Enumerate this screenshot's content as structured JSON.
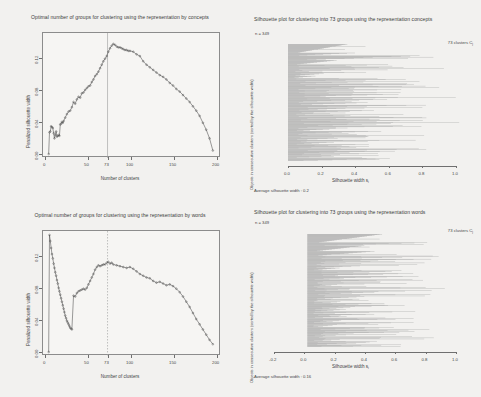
{
  "figure": {
    "background_color": "#f2f1ef",
    "line_color": "#4a4a4a",
    "bar_color": "#a9a9a9",
    "axis_color": "#6f6f6f"
  },
  "panels": {
    "top_left": {
      "title": "Optimal number of groups for clustering using the representation by concepts",
      "xlabel": "Number of clusters",
      "ylabel": "Penalized silhouette width",
      "xticks": [
        "0",
        "50",
        "73",
        "100",
        "150",
        "200"
      ],
      "yticks": [
        "0.00",
        "0.04",
        "0.08",
        "0.12"
      ],
      "marker_label": "73"
    },
    "top_right": {
      "title": "Silhouette plot for clustering into 73 groups using the representation concepts",
      "n_label": "n = 349",
      "clusters_label": "73 clusters",
      "clusters_symbol": "C",
      "clusters_subscript": "j",
      "ylabel": "Objects in consecutive clusters (sorted by the silhouette width)",
      "xlabel": "Silhouette width s",
      "xlabel_subscript": "i",
      "xticks": [
        "0.0",
        "0.2",
        "0.4",
        "0.6",
        "0.8",
        "1.0"
      ],
      "footer": "Average silhouette width :  0.2"
    },
    "bottom_left": {
      "title": "Optimal number of groups for clustering using the representation by words",
      "xlabel": "Number of clusters",
      "ylabel": "Penalized silhouette width",
      "xticks": [
        "0",
        "50",
        "73",
        "100",
        "150",
        "200"
      ],
      "yticks": [
        "0.00",
        "0.04",
        "0.08",
        "0.12"
      ],
      "marker_label": "73"
    },
    "bottom_right": {
      "title": "Silhouette plot for clustering into 73 groups using the representation words",
      "n_label": "n = 349",
      "clusters_label": "73 clusters",
      "clusters_symbol": "C",
      "clusters_subscript": "j",
      "ylabel": "Objects in consecutive clusters (sorted by the silhouette width)",
      "xlabel": "Silhouette width s",
      "xlabel_subscript": "i",
      "xticks": [
        "-0.2",
        "0.0",
        "0.2",
        "0.4",
        "0.6",
        "0.8",
        "1.0"
      ],
      "footer": "Average silhouette width :  0.16"
    }
  },
  "chart_data": [
    {
      "id": "top_left",
      "type": "line",
      "title": "Optimal number of groups for clustering using the representation by concepts",
      "xlabel": "Number of clusters",
      "ylabel": "Penalized silhouette width",
      "xlim": [
        0,
        205
      ],
      "ylim": [
        0.0,
        0.135
      ],
      "grid": false,
      "vline": 73,
      "marker": "circle-open",
      "x": [
        2,
        3,
        4,
        5,
        6,
        7,
        8,
        9,
        10,
        11,
        12,
        13,
        14,
        15,
        16,
        17,
        18,
        19,
        20,
        22,
        24,
        26,
        28,
        30,
        32,
        34,
        36,
        38,
        40,
        42,
        44,
        46,
        48,
        50,
        52,
        54,
        56,
        58,
        60,
        62,
        64,
        66,
        68,
        70,
        72,
        74,
        76,
        78,
        80,
        82,
        84,
        86,
        88,
        90,
        92,
        94,
        96,
        98,
        100,
        104,
        108,
        112,
        116,
        120,
        124,
        128,
        132,
        136,
        140,
        144,
        148,
        152,
        156,
        160,
        164,
        168,
        172,
        176,
        180,
        184,
        188,
        192,
        196,
        200
      ],
      "y": [
        0.0,
        0.025,
        0.026,
        0.032,
        0.031,
        0.03,
        0.024,
        0.018,
        0.022,
        0.026,
        0.02,
        0.021,
        0.022,
        0.021,
        0.034,
        0.035,
        0.037,
        0.036,
        0.038,
        0.042,
        0.046,
        0.049,
        0.05,
        0.054,
        0.06,
        0.058,
        0.063,
        0.066,
        0.065,
        0.07,
        0.071,
        0.074,
        0.076,
        0.078,
        0.079,
        0.083,
        0.086,
        0.09,
        0.092,
        0.095,
        0.099,
        0.103,
        0.107,
        0.11,
        0.113,
        0.118,
        0.122,
        0.125,
        0.127,
        0.126,
        0.124,
        0.123,
        0.123,
        0.122,
        0.121,
        0.12,
        0.12,
        0.119,
        0.119,
        0.118,
        0.115,
        0.113,
        0.107,
        0.103,
        0.1,
        0.097,
        0.094,
        0.091,
        0.089,
        0.086,
        0.082,
        0.079,
        0.075,
        0.072,
        0.068,
        0.064,
        0.06,
        0.055,
        0.05,
        0.044,
        0.036,
        0.028,
        0.018,
        0.004
      ]
    },
    {
      "id": "bottom_left",
      "type": "line",
      "title": "Optimal number of groups for clustering using the representation by words",
      "xlabel": "Number of clusters",
      "ylabel": "Penalized silhouette width",
      "xlim": [
        0,
        205
      ],
      "ylim": [
        0.0,
        0.135
      ],
      "grid": false,
      "vline": 73,
      "marker": "circle-open",
      "x": [
        2,
        3,
        4,
        5,
        6,
        7,
        8,
        9,
        10,
        11,
        12,
        13,
        14,
        15,
        16,
        17,
        18,
        19,
        20,
        21,
        22,
        23,
        24,
        25,
        26,
        27,
        28,
        29,
        30,
        32,
        34,
        36,
        38,
        40,
        42,
        44,
        46,
        48,
        50,
        52,
        54,
        56,
        58,
        60,
        62,
        64,
        66,
        68,
        70,
        72,
        74,
        76,
        78,
        80,
        84,
        88,
        92,
        96,
        100,
        104,
        108,
        112,
        116,
        120,
        124,
        128,
        132,
        136,
        140,
        144,
        148,
        152,
        156,
        160,
        164,
        168,
        172,
        176,
        180,
        184,
        188,
        192,
        196,
        200
      ],
      "y": [
        0.0,
        0.135,
        0.128,
        0.12,
        0.113,
        0.108,
        0.102,
        0.097,
        0.092,
        0.088,
        0.083,
        0.079,
        0.074,
        0.07,
        0.066,
        0.062,
        0.058,
        0.054,
        0.05,
        0.046,
        0.042,
        0.039,
        0.036,
        0.034,
        0.032,
        0.03,
        0.028,
        0.027,
        0.026,
        0.065,
        0.064,
        0.068,
        0.07,
        0.071,
        0.072,
        0.073,
        0.072,
        0.074,
        0.078,
        0.082,
        0.086,
        0.09,
        0.095,
        0.098,
        0.1,
        0.099,
        0.1,
        0.101,
        0.101,
        0.103,
        0.104,
        0.102,
        0.103,
        0.101,
        0.1,
        0.099,
        0.098,
        0.097,
        0.098,
        0.096,
        0.093,
        0.09,
        0.088,
        0.086,
        0.085,
        0.082,
        0.08,
        0.081,
        0.079,
        0.077,
        0.078,
        0.076,
        0.073,
        0.069,
        0.064,
        0.058,
        0.052,
        0.045,
        0.038,
        0.032,
        0.026,
        0.02,
        0.014,
        0.009
      ]
    },
    {
      "id": "top_right",
      "type": "bar",
      "orientation": "horizontal",
      "title": "Silhouette plot for clustering into 73 groups using the representation concepts",
      "xlabel": "Silhouette width s_i",
      "ylabel": "Objects in consecutive clusters (sorted by the silhouette width)",
      "xlim": [
        0.0,
        1.0
      ],
      "n": 349,
      "clusters": 73,
      "average_silhouette_width": 0.2,
      "xticks": [
        0.0,
        0.2,
        0.4,
        0.6,
        0.8,
        1.0
      ]
    },
    {
      "id": "bottom_right",
      "type": "bar",
      "orientation": "horizontal",
      "title": "Silhouette plot for clustering into 73 groups using the representation words",
      "xlabel": "Silhouette width s_i",
      "ylabel": "Objects in consecutive clusters (sorted by the silhouette width)",
      "xlim": [
        -0.2,
        1.0
      ],
      "n": 349,
      "clusters": 73,
      "average_silhouette_width": 0.16,
      "xticks": [
        -0.2,
        0.0,
        0.2,
        0.4,
        0.6,
        0.8,
        1.0
      ]
    }
  ]
}
